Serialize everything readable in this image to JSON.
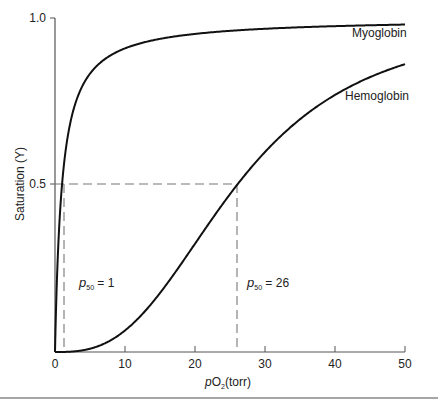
{
  "chart_data": {
    "type": "line",
    "title": "",
    "xlabel": "pO2(torr)",
    "xlabel_parts": {
      "italic": "p",
      "main": "O",
      "sub": "2",
      "tail": "(torr)"
    },
    "ylabel": "Saturation (Y)",
    "xlim": [
      0,
      50
    ],
    "ylim": [
      0,
      1.0
    ],
    "x_ticks": [
      "0",
      "10",
      "20",
      "30",
      "40",
      "50"
    ],
    "y_ticks": [
      "0.5",
      "1.0"
    ],
    "grid": false,
    "legend": "inline labels",
    "series": [
      {
        "name": "Myoglobin",
        "p50": 1,
        "hill_n": 1,
        "x": [
          0,
          1,
          2,
          5,
          10,
          20,
          30,
          40,
          50
        ],
        "values": [
          0,
          0.5,
          0.67,
          0.83,
          0.91,
          0.95,
          0.97,
          0.98,
          0.98
        ]
      },
      {
        "name": "Hemoglobin",
        "p50": 26,
        "hill_n": 2.8,
        "x": [
          0,
          5,
          10,
          15,
          20,
          26,
          30,
          40,
          50
        ],
        "values": [
          0,
          0.01,
          0.07,
          0.18,
          0.32,
          0.5,
          0.6,
          0.77,
          0.86
        ]
      }
    ],
    "annotations": [
      {
        "text": "p50 = 1",
        "sub": "50",
        "value": "1",
        "x": 1,
        "y": 0.5
      },
      {
        "text": "p50 = 26",
        "sub": "50",
        "value": "26",
        "x": 26,
        "y": 0.5
      }
    ]
  },
  "labels": {
    "myoglobin": "Myoglobin",
    "hemoglobin": "Hemoglobin",
    "p50_1_p": "p",
    "p50_1_sub": "50",
    "p50_1_val": " = 1",
    "p50_26_p": "p",
    "p50_26_sub": "50",
    "p50_26_val": " = 26",
    "ylabel": "Saturation (Y)",
    "xlabel_p": "p",
    "xlabel_o": "O",
    "xlabel_sub": "2",
    "xlabel_tail": "(torr)",
    "tick_y_1": "1.0",
    "tick_y_05": "0.5",
    "tick_x_0": "0",
    "tick_x_10": "10",
    "tick_x_20": "20",
    "tick_x_30": "30",
    "tick_x_40": "40",
    "tick_x_50": "50"
  }
}
